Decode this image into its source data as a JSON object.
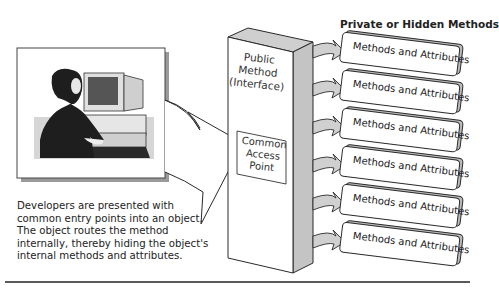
{
  "diagram": {
    "header": "Private or Hidden Methods",
    "column": {
      "public_label": [
        "Public",
        "Method",
        "(Interface)"
      ],
      "access_label": [
        "Common",
        "Access",
        "Point"
      ]
    },
    "method_boxes": [
      {
        "label": "Methods and Attributes"
      },
      {
        "label": "Methods and Attributes"
      },
      {
        "label": "Methods and Attributes"
      },
      {
        "label": "Methods and Attributes"
      },
      {
        "label": "Methods and Attributes"
      },
      {
        "label": "Methods and Attributes"
      }
    ],
    "caption": "Developers are presented with common entry points into an object. The object routes the method internally, thereby hiding the object's internal methods and attributes.",
    "illustration": "developer at computer workstation",
    "colors": {
      "column_side": "#c8c8c8",
      "arrow_fill": "#d0d0d0",
      "stroke": "#2a2a2a"
    }
  }
}
